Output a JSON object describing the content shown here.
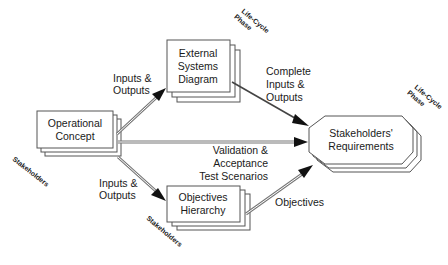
{
  "diagram": {
    "nodes": {
      "operational_concept": {
        "line1": "Operational",
        "line2": "Concept"
      },
      "external_systems": {
        "line1": "External",
        "line2": "Systems",
        "line3": "Diagram"
      },
      "objectives_hierarchy": {
        "line1": "Objectives",
        "line2": "Hierarchy"
      },
      "stakeholders_requirements": {
        "line1": "Stakeholders'",
        "line2": "Requirements"
      }
    },
    "edges": {
      "oc_to_esd": {
        "line1": "Inputs &",
        "line2": "Outputs"
      },
      "esd_to_sr": {
        "line1": "Complete",
        "line2": "Inputs &",
        "line3": "Outputs"
      },
      "oc_to_sr": {
        "line1": "Validation &",
        "line2": "Acceptance",
        "line3": "Test Scenarios"
      },
      "oc_to_oh": {
        "line1": "Inputs &",
        "line2": "Outputs"
      },
      "oh_to_sr": {
        "line1": "Objectives"
      }
    },
    "stack_labels": {
      "operational_concept": "Stakeholders",
      "objectives_hierarchy": "Stakeholders",
      "external_systems": {
        "line1": "Life-Cycle",
        "line2": "Phase"
      },
      "stakeholders_requirements": {
        "line1": "Life-Cycle",
        "line2": "Phase"
      }
    }
  }
}
